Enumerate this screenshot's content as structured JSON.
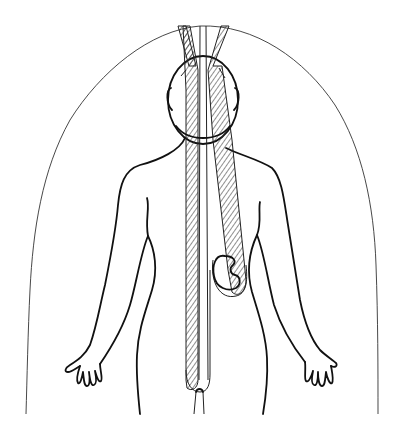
{
  "figure": {
    "colors": {
      "background": "#ffffff",
      "line": "#111111",
      "hatch": "#333333"
    },
    "elements": [
      {
        "name": "field-boundary",
        "label": "dome-shaped wavy outline surrounding the figure"
      },
      {
        "name": "human-body",
        "label": "front-view body outline with arms and hands"
      },
      {
        "name": "head",
        "label": "oval head"
      },
      {
        "name": "left-band",
        "label": "hatched band descending along the left of the midline to the pelvis"
      },
      {
        "name": "right-band",
        "label": "hatched band descending diagonally to the kidney"
      },
      {
        "name": "center-channel",
        "label": "narrow unhatched channel between the bands"
      },
      {
        "name": "kidney",
        "label": "kidney-shaped organ at lower right abdomen"
      }
    ]
  }
}
